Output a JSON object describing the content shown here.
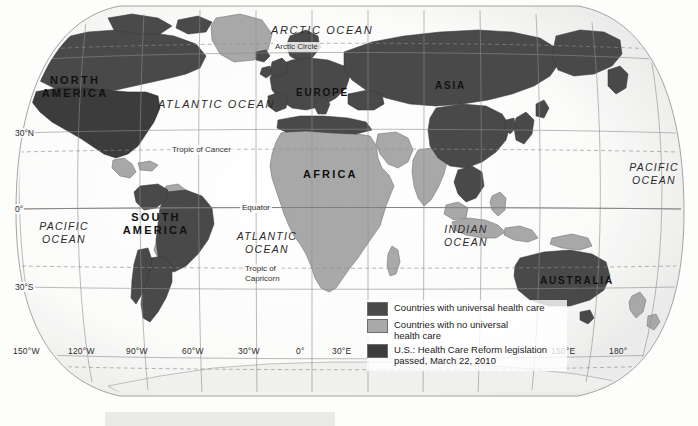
{
  "map": {
    "projection": "robinson",
    "title_visible": false,
    "background_color": "#fdfdfc",
    "graticule_color": "#8d8d8d",
    "colors": {
      "universal": "#4a4a4a",
      "no_universal": "#a9a9a9",
      "us_reform": "#3d3d3d",
      "ocean": "#fafaf9",
      "coastline": "#6f6f6f",
      "graticule": "#8d8d8d",
      "antarctica": "#f2f2f0"
    }
  },
  "continents": [
    {
      "name": "north-america",
      "label": "NORTH\nAMERICA",
      "line1": "NORTH",
      "line2": "AMERICA",
      "x": 66,
      "y": 74
    },
    {
      "name": "south-america",
      "label": "SOUTH\nAMERICA",
      "line1": "SOUTH",
      "line2": "AMERICA",
      "x": 144,
      "y": 211
    },
    {
      "name": "europe",
      "label": "EUROPE",
      "line1": "EUROPE",
      "line2": "",
      "x": 299,
      "y": 86
    },
    {
      "name": "africa",
      "label": "AFRICA",
      "line1": "AFRICA",
      "line2": "",
      "x": 305,
      "y": 168
    },
    {
      "name": "asia",
      "label": "ASIA",
      "line1": "ASIA",
      "line2": "",
      "x": 437,
      "y": 79
    },
    {
      "name": "australia",
      "label": "AUSTRALIA",
      "line1": "AUSTRALIA",
      "line2": "",
      "x": 541,
      "y": 274
    }
  ],
  "oceans": [
    {
      "name": "arctic-ocean",
      "line1": "ARCTIC OCEAN",
      "line2": "",
      "x": 271,
      "y": 24,
      "size": "big"
    },
    {
      "name": "atlantic-ocean-north",
      "line1": "ATLANTIC OCEAN",
      "line2": "",
      "x": 160,
      "y": 98,
      "size": "big"
    },
    {
      "name": "atlantic-ocean-south",
      "line1": "ATLANTIC",
      "line2": "OCEAN",
      "x": 238,
      "y": 232,
      "size": "normal"
    },
    {
      "name": "pacific-ocean-west",
      "line1": "PACIFIC",
      "line2": "OCEAN",
      "x": 37,
      "y": 222,
      "size": "normal"
    },
    {
      "name": "pacific-ocean-east",
      "line1": "PACIFIC",
      "line2": "OCEAN",
      "x": 625,
      "y": 163,
      "size": "normal"
    },
    {
      "name": "indian-ocean",
      "line1": "INDIAN",
      "line2": "OCEAN",
      "x": 437,
      "y": 225,
      "size": "normal"
    }
  ],
  "reference_lines": [
    {
      "name": "arctic-circle",
      "label": "Arctic Circle",
      "x": 273,
      "y": 46,
      "lines": [
        "Arctic Circle"
      ]
    },
    {
      "name": "tropic-of-cancer",
      "label": "Tropic of Cancer",
      "x": 170,
      "y": 148,
      "lines": [
        "Tropic of Cancer"
      ]
    },
    {
      "name": "equator",
      "label": "Equator",
      "x": 240,
      "y": 205,
      "lines": [
        "Equator"
      ]
    },
    {
      "name": "tropic-of-capricorn",
      "label": "Tropic of Capricorn",
      "x": 243,
      "y": 268,
      "lines": [
        "Tropic of",
        "Capricorn"
      ]
    }
  ],
  "latitude_labels": [
    {
      "name": "lat-30n",
      "label": "30°N",
      "x": 14,
      "y": 133
    },
    {
      "name": "lat-0",
      "label": "0°",
      "x": 14,
      "y": 209
    },
    {
      "name": "lat-30s",
      "label": "30°S",
      "x": 14,
      "y": 287
    }
  ],
  "longitude_labels": [
    {
      "name": "lon-150w",
      "label": "150°W",
      "x": 13,
      "y": 347
    },
    {
      "name": "lon-120w",
      "label": "120°W",
      "x": 68,
      "y": 347
    },
    {
      "name": "lon-90w",
      "label": "90°W",
      "x": 126,
      "y": 347
    },
    {
      "name": "lon-60w",
      "label": "60°W",
      "x": 182,
      "y": 347
    },
    {
      "name": "lon-30w",
      "label": "30°W",
      "x": 238,
      "y": 347
    },
    {
      "name": "lon-0",
      "label": "0°",
      "x": 297,
      "y": 347
    },
    {
      "name": "lon-30e",
      "label": "30°E",
      "x": 334,
      "y": 347
    },
    {
      "name": "lon-150e",
      "label": "150°E",
      "x": 552,
      "y": 347
    },
    {
      "name": "lon-180",
      "label": "180°",
      "x": 610,
      "y": 347
    }
  ],
  "legend": {
    "items": [
      {
        "name": "legend-universal",
        "label": "Countries with universal health care",
        "lines": [
          "Countries with universal health care"
        ],
        "color": "#4a4a4a"
      },
      {
        "name": "legend-no-universal",
        "label": "Countries with no universal health care",
        "lines": [
          "Countries with no universal",
          "health care"
        ],
        "color": "#a9a9a9"
      },
      {
        "name": "legend-us-reform",
        "label": "U.S.: Health Care Reform legislation passed, March 22, 2010",
        "lines": [
          "U.S.: Health Care Reform legislation",
          "passed, March 22, 2010"
        ],
        "color": "#3d3d3d"
      }
    ]
  }
}
